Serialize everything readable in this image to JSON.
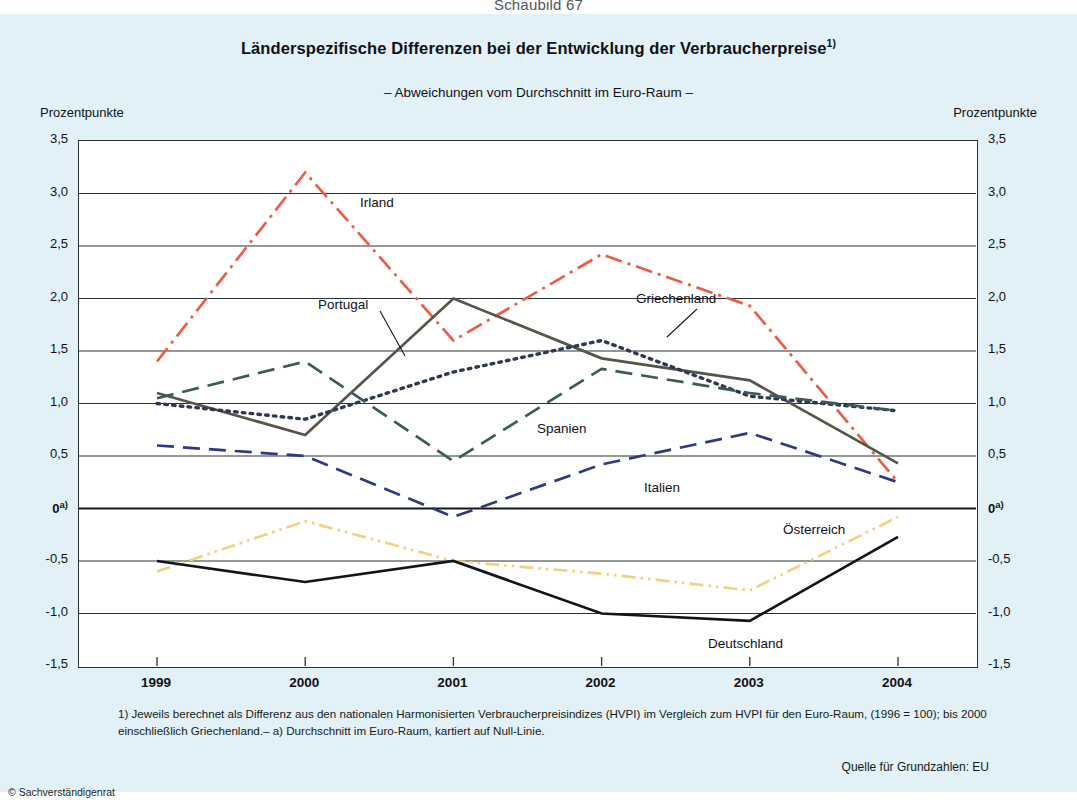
{
  "figure_number": "Schaubild 67",
  "title": "Länderspezifische Differenzen bei der Entwicklung der Verbraucherpreise",
  "title_footnote_marker": "1)",
  "subtitle": "– Abweichungen vom Durchschnitt im Euro-Raum –",
  "unit_left": "Prozentpunkte",
  "unit_right": "Prozentpunkte",
  "zero_marker": "a)",
  "footnote": "1) Jeweils berechnet als Differenz aus den nationalen Harmonisierten Verbraucherpreisindizes (HVPI) im Vergleich zum HVPI für den Euro-Raum, (1996 = 100); bis 2000 einschließlich Griechenland.– a) Durchschnitt im Euro-Raum, kartiert auf Null-Linie.",
  "source": "Quelle für Grundzahlen: EU",
  "copyright": "© Sachverständigenrat",
  "chart_data": {
    "type": "line",
    "title": "Länderspezifische Differenzen bei der Entwicklung der Verbraucherpreise",
    "subtitle": "– Abweichungen vom Durchschnitt im Euro-Raum –",
    "xlabel": "",
    "ylabel": "Prozentpunkte",
    "ylim": [
      -1.5,
      3.5
    ],
    "ytick_labels": [
      "3,5",
      "3,0",
      "2,5",
      "2,0",
      "1,5",
      "1,0",
      "0,5",
      "0",
      "-0,5",
      "-1,0",
      "-1,5"
    ],
    "ytick_values": [
      3.5,
      3.0,
      2.5,
      2.0,
      1.5,
      1.0,
      0.5,
      0,
      -0.5,
      -1.0,
      -1.5
    ],
    "grid": true,
    "legend_position": "inline-labels",
    "categories": [
      "1999",
      "2000",
      "2001",
      "2002",
      "2003",
      "2004"
    ],
    "x": [
      1999,
      2000,
      2001,
      2002,
      2003,
      2004
    ],
    "series": [
      {
        "name": "Irland",
        "color": "#ef5b46",
        "style": "dash-dot",
        "values": [
          1.4,
          3.2,
          1.6,
          2.42,
          1.93,
          0.25
        ]
      },
      {
        "name": "Portugal",
        "color": "#55564a",
        "style": "solid",
        "values": [
          1.1,
          0.7,
          2.0,
          1.43,
          1.22,
          0.43
        ]
      },
      {
        "name": "Griechenland",
        "color": "#2f3a52",
        "style": "dotted",
        "values": [
          1.0,
          0.85,
          1.3,
          1.6,
          1.07,
          0.93
        ]
      },
      {
        "name": "Spanien",
        "color": "#3d5b57",
        "style": "dashed",
        "values": [
          1.05,
          1.4,
          0.45,
          1.33,
          1.1,
          0.93
        ]
      },
      {
        "name": "Italien",
        "color": "#2e3a86",
        "style": "dashed",
        "values": [
          0.6,
          0.5,
          -0.08,
          0.42,
          0.72,
          0.25
        ]
      },
      {
        "name": "Österreich",
        "color": "#f2d27e",
        "style": "dash-dot-dot",
        "values": [
          -0.6,
          -0.12,
          -0.5,
          -0.62,
          -0.78,
          -0.08
        ]
      },
      {
        "name": "Deutschland",
        "color": "#11161c",
        "style": "solid",
        "values": [
          -0.5,
          -0.7,
          -0.5,
          -1.0,
          -1.07,
          -0.27
        ]
      }
    ],
    "series_labels": [
      {
        "name": "Irland",
        "x": 360,
        "y": 195
      },
      {
        "name": "Portugal",
        "x": 318,
        "y": 297
      },
      {
        "name": "Griechenland",
        "x": 636,
        "y": 291
      },
      {
        "name": "Spanien",
        "x": 537,
        "y": 421
      },
      {
        "name": "Italien",
        "x": 644,
        "y": 480
      },
      {
        "name": "Österreich",
        "x": 783,
        "y": 522
      },
      {
        "name": "Deutschland",
        "x": 708,
        "y": 636
      }
    ]
  }
}
